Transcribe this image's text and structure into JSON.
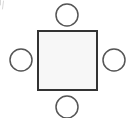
{
  "canvas": {
    "width": 127,
    "height": 118,
    "background_color": "#ffffff",
    "title": "Square with four surrounding circles"
  },
  "style": {
    "square_stroke_color": "#333333",
    "square_fill_color": "#f7f7f7",
    "square_stroke_width": 2,
    "circle_stroke_color": "#555555",
    "circle_fill_color": "#ffffff",
    "circle_stroke_width": 1.5,
    "artifact_color": "#d8d8d8"
  },
  "shapes": {
    "center_square": {
      "name": "center-square",
      "type": "square",
      "x": 38,
      "y": 31,
      "width": 59,
      "height": 59,
      "label": ""
    },
    "circles": [
      {
        "name": "circle-top",
        "position": "top",
        "cx": 67,
        "cy": 15,
        "r": 11,
        "label": ""
      },
      {
        "name": "circle-right",
        "position": "right",
        "cx": 114,
        "cy": 60,
        "r": 11,
        "label": ""
      },
      {
        "name": "circle-bottom",
        "position": "bottom",
        "cx": 67,
        "cy": 107,
        "r": 11,
        "label": ""
      },
      {
        "name": "circle-left",
        "position": "left",
        "cx": 21,
        "cy": 60,
        "r": 11,
        "label": ""
      }
    ],
    "corner_artifact": {
      "name": "corner-artifact",
      "x": 0,
      "y": 0,
      "width": 5,
      "height": 9
    }
  }
}
